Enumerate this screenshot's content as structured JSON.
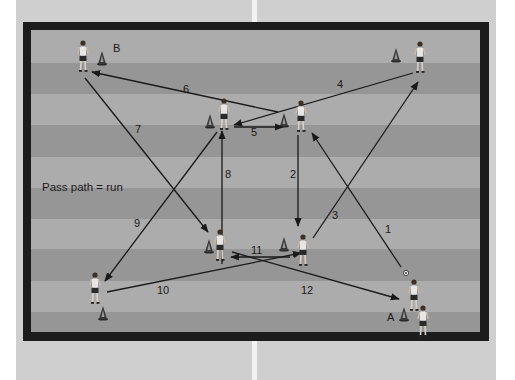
{
  "colors": {
    "page_bg": "#cfcfcf",
    "frame": "#1c1c1c",
    "stripe_light": "#acacac",
    "stripe_dark": "#969696",
    "line": "#1a1a1a",
    "cone": "#3a3a3a",
    "shirt": "#e6e6e6",
    "shorts": "#2a2a2a"
  },
  "diagram": {
    "caption": "Pass path = run",
    "group_labels": [
      {
        "id": "B",
        "text": "B",
        "x": 113,
        "y": 52
      },
      {
        "id": "A",
        "text": "A",
        "x": 387,
        "y": 321
      }
    ],
    "stripes": [
      {
        "y": 0,
        "h": 33,
        "tone": "light"
      },
      {
        "y": 33,
        "h": 31,
        "tone": "dark"
      },
      {
        "y": 64,
        "h": 31,
        "tone": "light"
      },
      {
        "y": 95,
        "h": 32,
        "tone": "dark"
      },
      {
        "y": 127,
        "h": 31,
        "tone": "light"
      },
      {
        "y": 158,
        "h": 31,
        "tone": "dark"
      },
      {
        "y": 189,
        "h": 30,
        "tone": "light"
      },
      {
        "y": 219,
        "h": 32,
        "tone": "dark"
      },
      {
        "y": 251,
        "h": 31,
        "tone": "light"
      },
      {
        "y": 282,
        "h": 20,
        "tone": "dark"
      }
    ],
    "players": [
      {
        "id": "player-b",
        "x": 83,
        "y": 41
      },
      {
        "id": "player-top-right",
        "x": 420,
        "y": 42
      },
      {
        "id": "player-center-top-left",
        "x": 224,
        "y": 99
      },
      {
        "id": "player-center-top-right",
        "x": 301,
        "y": 101
      },
      {
        "id": "player-center-bottom-left",
        "x": 220,
        "y": 230
      },
      {
        "id": "player-center-bottom-right",
        "x": 303,
        "y": 235
      },
      {
        "id": "player-left",
        "x": 95,
        "y": 273
      },
      {
        "id": "player-a-1",
        "x": 414,
        "y": 280
      },
      {
        "id": "player-a-2",
        "x": 423,
        "y": 306
      }
    ],
    "cones": [
      {
        "x": 102,
        "y": 58
      },
      {
        "x": 396,
        "y": 55
      },
      {
        "x": 210,
        "y": 121
      },
      {
        "x": 284,
        "y": 120
      },
      {
        "x": 209,
        "y": 246
      },
      {
        "x": 284,
        "y": 244
      },
      {
        "x": 103,
        "y": 313
      },
      {
        "x": 404,
        "y": 314
      }
    ],
    "ball": {
      "x": 406,
      "y": 273
    },
    "passes": [
      {
        "n": "1",
        "x1": 401,
        "y1": 267,
        "x2": 312,
        "y2": 133,
        "lx": 385,
        "ly": 233
      },
      {
        "n": "2",
        "x1": 298,
        "y1": 135,
        "x2": 298,
        "y2": 226,
        "lx": 290,
        "ly": 178
      },
      {
        "n": "3",
        "x1": 313,
        "y1": 238,
        "x2": 418,
        "y2": 82,
        "lx": 332,
        "ly": 219
      },
      {
        "n": "4",
        "x1": 413,
        "y1": 73,
        "x2": 234,
        "y2": 125,
        "lx": 337,
        "ly": 88
      },
      {
        "n": "5",
        "x1": 234,
        "y1": 127,
        "x2": 283,
        "y2": 127,
        "lx": 251,
        "ly": 136
      },
      {
        "n": "6",
        "x1": 278,
        "y1": 112,
        "x2": 92,
        "y2": 72,
        "lx": 183,
        "ly": 93
      },
      {
        "n": "7",
        "x1": 85,
        "y1": 78,
        "x2": 208,
        "y2": 232,
        "lx": 135,
        "ly": 133
      },
      {
        "n": "8",
        "x1": 222,
        "y1": 264,
        "x2": 222,
        "y2": 131,
        "lx": 225,
        "ly": 178
      },
      {
        "n": "9",
        "x1": 217,
        "y1": 132,
        "x2": 105,
        "y2": 281,
        "lx": 134,
        "ly": 227
      },
      {
        "n": "10",
        "x1": 107,
        "y1": 292,
        "x2": 301,
        "y2": 253,
        "lx": 157,
        "ly": 294
      },
      {
        "n": "11",
        "x1": 290,
        "y1": 257,
        "x2": 231,
        "y2": 257,
        "lx": 251,
        "ly": 254
      },
      {
        "n": "12",
        "x1": 232,
        "y1": 252,
        "x2": 399,
        "y2": 299,
        "lx": 301,
        "ly": 294
      }
    ]
  }
}
